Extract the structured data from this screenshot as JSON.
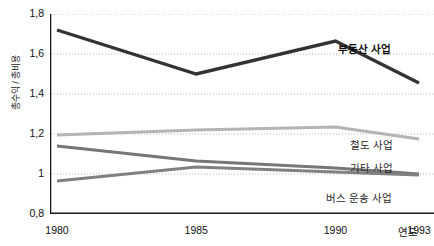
{
  "chart_data": {
    "type": "line",
    "title": "",
    "xlabel": "연도",
    "ylabel": "총수익 / 총비용",
    "x": [
      1980,
      1985,
      1990,
      1993
    ],
    "xticklabels": [
      "1980",
      "1985",
      "1990",
      "1993"
    ],
    "yticklabels": [
      "1,8",
      "1,6",
      "1,4",
      "1,2",
      "1",
      "0,8"
    ],
    "yticks": [
      1.8,
      1.6,
      1.4,
      1.2,
      1.0,
      0.8
    ],
    "ylim": [
      0.8,
      1.8
    ],
    "xlim": [
      1980,
      1993
    ],
    "grid": "horizontal-dotted",
    "legend_position": "inline-right",
    "series": [
      {
        "name": "부동산 사업",
        "values": [
          1.72,
          1.5,
          1.665,
          1.455
        ],
        "color": "#333333",
        "width": 3.4
      },
      {
        "name": "철도 사업",
        "values": [
          1.195,
          1.22,
          1.235,
          1.175
        ],
        "color": "#b4b4b4",
        "width": 3.0
      },
      {
        "name": "기타 사업",
        "values": [
          1.14,
          1.065,
          1.03,
          1.0
        ],
        "color": "#767676",
        "width": 3.0
      },
      {
        "name": "버스 운송 사업",
        "values": [
          0.965,
          1.035,
          1.01,
          0.995
        ],
        "color": "#808080",
        "width": 3.0
      }
    ]
  },
  "axes": {
    "y_title": "총수익 / 총비용",
    "x_title": "연도",
    "axis_color": "#1a1a1a",
    "grid_color": "#aaaaaa"
  },
  "series_labels": [
    {
      "text": "부동산 사업",
      "top": 41,
      "left": 338
    },
    {
      "text": "철도 사업",
      "top": 137,
      "left": 350
    },
    {
      "text": "기타 사업",
      "top": 160,
      "left": 350
    },
    {
      "text": "버스 운송 사업",
      "top": 190,
      "left": 326
    }
  ]
}
